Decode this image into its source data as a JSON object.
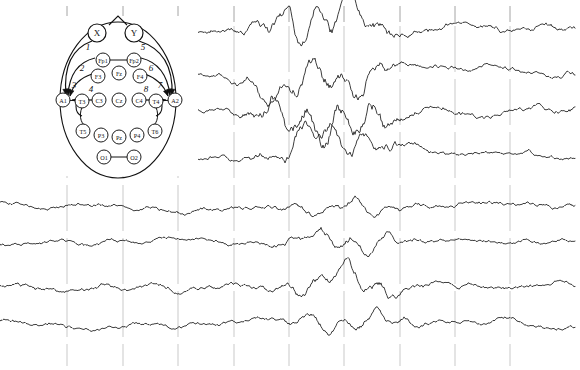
{
  "view": {
    "title": "EEG Recording with 10-20 Montage Head Diagram",
    "width": 580,
    "height": 370,
    "background_color": "#ffffff",
    "trace_color": "#1a1a1a",
    "gridline_color": "#9a9a9a",
    "diagram_color": "#111111"
  },
  "head_diagram": {
    "name": "10-20 electrode placement map",
    "center_x": 118,
    "center_y": 100,
    "radius_x": 58,
    "radius_y": 78,
    "reference_nodes": [
      {
        "label": "X",
        "x": 97,
        "y": 33,
        "r": 9
      },
      {
        "label": "Y",
        "x": 134,
        "y": 33,
        "r": 9
      }
    ],
    "electrodes": [
      {
        "label": "Fp1",
        "x": 103,
        "y": 60,
        "r": 7
      },
      {
        "label": "Fp2",
        "x": 134,
        "y": 60,
        "r": 7
      },
      {
        "label": "F3",
        "x": 98,
        "y": 76,
        "r": 7
      },
      {
        "label": "Fz",
        "x": 119,
        "y": 73,
        "r": 7
      },
      {
        "label": "F4",
        "x": 140,
        "y": 76,
        "r": 7
      },
      {
        "label": "A1",
        "x": 63,
        "y": 100,
        "r": 7
      },
      {
        "label": "T3",
        "x": 82,
        "y": 101,
        "r": 7
      },
      {
        "label": "C3",
        "x": 99,
        "y": 100,
        "r": 7
      },
      {
        "label": "Cz",
        "x": 119,
        "y": 100,
        "r": 7
      },
      {
        "label": "C4",
        "x": 139,
        "y": 100,
        "r": 7
      },
      {
        "label": "T4",
        "x": 156,
        "y": 101,
        "r": 7
      },
      {
        "label": "A2",
        "x": 175,
        "y": 100,
        "r": 7
      },
      {
        "label": "T5",
        "x": 83,
        "y": 131,
        "r": 7
      },
      {
        "label": "P3",
        "x": 101,
        "y": 135,
        "r": 7
      },
      {
        "label": "Pz",
        "x": 119,
        "y": 137,
        "r": 7
      },
      {
        "label": "P4",
        "x": 137,
        "y": 135,
        "r": 7
      },
      {
        "label": "T6",
        "x": 155,
        "y": 131,
        "r": 7
      },
      {
        "label": "O1",
        "x": 104,
        "y": 157,
        "r": 7
      },
      {
        "label": "O2",
        "x": 134,
        "y": 157,
        "r": 7
      }
    ],
    "derivation_labels": [
      {
        "label": "1",
        "x": 88,
        "y": 50
      },
      {
        "label": "2",
        "x": 82,
        "y": 71
      },
      {
        "label": "3",
        "x": 74,
        "y": 88
      },
      {
        "label": "4",
        "x": 91,
        "y": 92
      },
      {
        "label": "5",
        "x": 143,
        "y": 50
      },
      {
        "label": "6",
        "x": 151,
        "y": 71
      },
      {
        "label": "7",
        "x": 160,
        "y": 88
      },
      {
        "label": "8",
        "x": 146,
        "y": 92
      }
    ]
  },
  "chart_data": {
    "type": "line",
    "xlabel": "",
    "ylabel": "",
    "grid": true,
    "legend_position": "none",
    "plot_area": {
      "x0": 0,
      "x1": 580,
      "y0": 0,
      "y1": 370
    },
    "gridlines_x": [
      67,
      123,
      178,
      234,
      289,
      344,
      400,
      455,
      510
    ],
    "gridline_top_ticks_y": [
      6,
      22
    ],
    "channel_count": 8,
    "channel_baselines_y": [
      30,
      70,
      107,
      155,
      207,
      241,
      286,
      324
    ],
    "channels": [
      {
        "index": 1,
        "baseline_y": 30,
        "amplitude": 11,
        "occluded_start_x": 178,
        "seed": 101,
        "burst": {
          "start_x": 225,
          "end_x": 420,
          "gain": 2.6
        }
      },
      {
        "index": 2,
        "baseline_y": 70,
        "amplitude": 10,
        "occluded_start_x": 178,
        "seed": 211,
        "burst": {
          "start_x": 225,
          "end_x": 420,
          "gain": 2.9
        }
      },
      {
        "index": 3,
        "baseline_y": 107,
        "amplitude": 11,
        "occluded_start_x": 178,
        "seed": 307,
        "burst": {
          "start_x": 225,
          "end_x": 430,
          "gain": 3.2
        }
      },
      {
        "index": 4,
        "baseline_y": 155,
        "amplitude": 9,
        "occluded_start_x": 178,
        "seed": 419,
        "burst": {
          "start_x": 228,
          "end_x": 430,
          "gain": 2.7
        }
      },
      {
        "index": 5,
        "baseline_y": 207,
        "amplitude": 9,
        "occluded_start_x": 0,
        "seed": 523,
        "burst": {
          "start_x": 260,
          "end_x": 430,
          "gain": 1.5
        }
      },
      {
        "index": 6,
        "baseline_y": 241,
        "amplitude": 8,
        "occluded_start_x": 0,
        "seed": 631,
        "burst": {
          "start_x": 250,
          "end_x": 440,
          "gain": 2.0
        }
      },
      {
        "index": 7,
        "baseline_y": 286,
        "amplitude": 9,
        "occluded_start_x": 0,
        "seed": 743,
        "burst": {
          "start_x": 250,
          "end_x": 440,
          "gain": 2.0
        }
      },
      {
        "index": 8,
        "baseline_y": 324,
        "amplitude": 8,
        "occluded_start_x": 0,
        "seed": 857,
        "burst": {
          "start_x": 250,
          "end_x": 450,
          "gain": 1.8
        }
      }
    ]
  }
}
